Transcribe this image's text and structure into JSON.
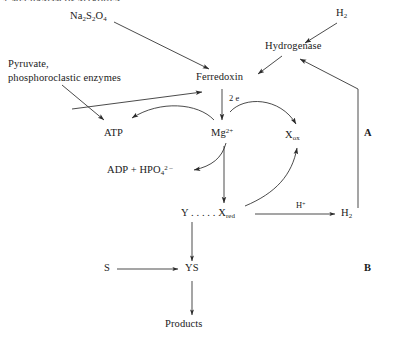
{
  "figure": {
    "title_fragment": "3. MECHANISM OF NITROGEN",
    "panels": [
      {
        "id": "A",
        "label": "A"
      },
      {
        "id": "B",
        "label": "B"
      }
    ]
  },
  "nodes": {
    "na2s2o4": {
      "label_html": "Na<sub>2</sub>S<sub>2</sub>O<sub>4</sub>",
      "text": "Na2S2O4"
    },
    "h2_top": {
      "label_html": "H<sub>2</sub>",
      "text": "H2"
    },
    "hydrogenase": {
      "label_html": "Hydrogenase",
      "text": "Hydrogenase"
    },
    "pyruvate": {
      "line1": "Pyruvate,",
      "line2": "phosphoroclastic enzymes"
    },
    "ferredoxin": {
      "label_html": "Ferredoxin",
      "text": "Ferredoxin"
    },
    "two_electrons": {
      "label_html": "2 e",
      "text": "2 e"
    },
    "atp": {
      "label_html": "ATP",
      "text": "ATP"
    },
    "mg": {
      "label_html": "Mg<sup>2+</sup>",
      "text": "Mg2+"
    },
    "xox": {
      "label_html": "X<sub>ox</sub>",
      "text": "Xox"
    },
    "adp": {
      "label_html": "ADP + HPO<sub>4</sub><sup>2 –</sup>",
      "text": "ADP + HPO4 2-"
    },
    "yxred": {
      "label_html": "Y . . . . . X<sub>red</sub>",
      "text": "Y.....Xred"
    },
    "hplus": {
      "label_html": "H<sup>+</sup>",
      "text": "H+"
    },
    "h2_right": {
      "label_html": "H<sub>2</sub>",
      "text": "H2"
    },
    "s": {
      "label_html": "S",
      "text": "S"
    },
    "ys": {
      "label_html": "YS",
      "text": "YS"
    },
    "products": {
      "label_html": "Products",
      "text": "Products"
    }
  },
  "edges": [
    {
      "id": "na2s2o4-to-ferredoxin",
      "from": "na2s2o4",
      "to": "ferredoxin",
      "style": "straight-arrow"
    },
    {
      "id": "h2top-to-hydrogenase",
      "from": "h2_top",
      "to": "hydrogenase",
      "style": "straight-arrow"
    },
    {
      "id": "hydrogenase-to-ferredoxin",
      "from": "hydrogenase",
      "to": "ferredoxin",
      "style": "straight-arrow"
    },
    {
      "id": "h2right-to-hydrogenase",
      "from": "h2_right",
      "to": "hydrogenase",
      "style": "elbow-arrow"
    },
    {
      "id": "pyruvate-to-ferredoxin",
      "from": "pyruvate",
      "to": "ferredoxin",
      "style": "straight-arrow"
    },
    {
      "id": "pyruvate-to-atp",
      "from": "pyruvate",
      "to": "atp",
      "style": "straight-arrow"
    },
    {
      "id": "ferredoxin-to-mg",
      "from": "ferredoxin",
      "to": "mg",
      "label": "two_electrons",
      "style": "straight-arrow"
    },
    {
      "id": "mg-to-atp",
      "from": "mg",
      "to": "atp",
      "style": "curved-arrow"
    },
    {
      "id": "mg-to-adp",
      "from": "mg",
      "to": "adp",
      "style": "curved-arrow"
    },
    {
      "id": "electrons-to-xox",
      "from": "two_electrons",
      "to": "xox",
      "style": "curved-arc"
    },
    {
      "id": "yxred-to-xox",
      "from": "yxred",
      "to": "xox",
      "style": "curved-arrow"
    },
    {
      "id": "mg-to-yxred",
      "from": "mg",
      "to": "yxred",
      "style": "straight-arrow"
    },
    {
      "id": "yxred-to-h2",
      "from": "yxred",
      "to": "h2_right",
      "label": "hplus",
      "style": "straight-arrow"
    },
    {
      "id": "yxred-to-ys",
      "from": "yxred",
      "to": "ys",
      "style": "straight-arrow"
    },
    {
      "id": "s-to-ys",
      "from": "s",
      "to": "ys",
      "style": "straight-arrow"
    },
    {
      "id": "ys-to-products",
      "from": "ys",
      "to": "products",
      "style": "straight-arrow"
    }
  ],
  "colors": {
    "ink": "#1a1a1a",
    "line": "#2b2b2b",
    "background": "#ffffff"
  }
}
